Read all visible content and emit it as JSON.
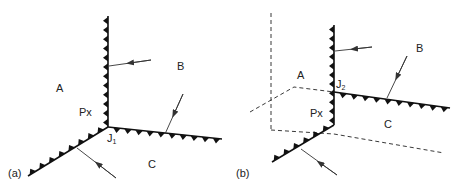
{
  "figure": {
    "panel_a": {
      "tag": "(a)",
      "regions": {
        "A": "A",
        "B": "B",
        "C": "C"
      },
      "px_label": "Px",
      "junction": {
        "main": "J",
        "sub": "1"
      }
    },
    "panel_b": {
      "tag": "(b)",
      "regions": {
        "A": "A",
        "B": "B",
        "C": "C"
      },
      "px_label": "Px",
      "junction": {
        "main": "J",
        "sub": "2"
      }
    }
  }
}
